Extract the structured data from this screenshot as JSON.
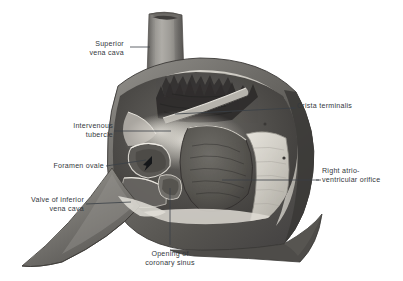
{
  "figure": {
    "kind": "anatomical-illustration",
    "style": "grayscale halftone engraving",
    "background_color": "#ffffff",
    "label_text_color": "#33383d",
    "leader_line_color": "#3a4046"
  },
  "labels": [
    {
      "id": "superior-vena-cava",
      "lines": [
        "Superior",
        "vena cava"
      ],
      "align": "right",
      "x": 84,
      "y": 40,
      "leader": {
        "type": "line",
        "x1": 130,
        "y1": 47,
        "x2": 150,
        "y2": 47
      }
    },
    {
      "id": "crista-terminalis",
      "lines": [
        "Crista terminalis"
      ],
      "align": "left",
      "x": 297,
      "y": 105,
      "leader": {
        "type": "line",
        "x1": 294,
        "y1": 108,
        "x2": 175,
        "y2": 114
      }
    },
    {
      "id": "intervenous-tubercle",
      "lines": [
        "Intervenous",
        "tubercle"
      ],
      "align": "right",
      "x": 69,
      "y": 122,
      "leader": {
        "type": "line",
        "x1": 114,
        "y1": 131,
        "x2": 171,
        "y2": 131
      }
    },
    {
      "id": "foramen-ovale",
      "lines": [
        "Foramen ovale"
      ],
      "align": "right",
      "x": 45,
      "y": 162,
      "leader": {
        "type": "arrow",
        "x1": 106,
        "y1": 166,
        "x2": 151,
        "y2": 158
      }
    },
    {
      "id": "right-atrioventricular-orifice",
      "lines": [
        "Right atrio-",
        "ventricular orifice"
      ],
      "align": "left",
      "x": 322,
      "y": 170,
      "leader": {
        "type": "line",
        "x1": 319,
        "y1": 180,
        "x2": 222,
        "y2": 180
      }
    },
    {
      "id": "valve-of-inferior-vena-cava",
      "lines": [
        "Valve of inferior",
        "vena cava"
      ],
      "align": "right",
      "x": 13,
      "y": 196,
      "leader": {
        "type": "line",
        "x1": 86,
        "y1": 204,
        "x2": 131,
        "y2": 202
      }
    },
    {
      "id": "opening-of-coronary-sinus",
      "lines": [
        "Opening of",
        "coronary sinus"
      ],
      "align": "center",
      "x": 146,
      "y": 250,
      "leader": {
        "type": "line",
        "x1": 170,
        "y1": 245,
        "x2": 170,
        "y2": 188
      }
    }
  ],
  "structures": [
    {
      "id": "superior-vena-cava-tube",
      "name": "Superior vena cava"
    },
    {
      "id": "atrial-wall",
      "name": "Right atrial wall"
    },
    {
      "id": "pectinate-muscles",
      "name": "Pectinate muscles"
    },
    {
      "id": "crista-terminalis-ridge",
      "name": "Crista terminalis"
    },
    {
      "id": "intervenous-tubercle-bulge",
      "name": "Intervenous tubercle"
    },
    {
      "id": "fossa-ovalis",
      "name": "Fossa ovalis / foramen ovale"
    },
    {
      "id": "inferior-vena-cava-trunk",
      "name": "Inferior vena cava"
    },
    {
      "id": "valve-of-ivc-fold",
      "name": "Valve of inferior vena cava"
    },
    {
      "id": "coronary-sinus-opening",
      "name": "Opening of coronary sinus"
    },
    {
      "id": "atrioventricular-orifice",
      "name": "Right atrioventricular orifice"
    },
    {
      "id": "tricuspid-valve-cusp",
      "name": "Tricuspid valve cusp"
    }
  ]
}
